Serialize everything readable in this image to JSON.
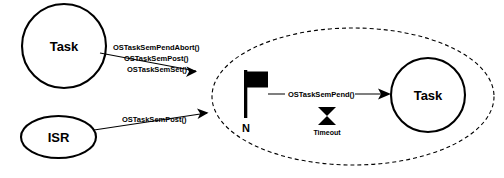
{
  "diagram": {
    "background_color": "#ffffff",
    "stroke_color": "#000000",
    "nodes": {
      "task_left": {
        "label": "Task",
        "shape": "circle"
      },
      "isr": {
        "label": "ISR",
        "shape": "ellipse"
      },
      "task_right": {
        "label": "Task",
        "shape": "circle"
      },
      "flag": {
        "label": "N",
        "shape": "flag"
      },
      "timeout": {
        "label": "Timeout",
        "shape": "hourglass"
      },
      "wait_region": {
        "label": "",
        "shape": "dashed-ellipse"
      }
    },
    "edges": {
      "task_to_region": {
        "labels": [
          "OSTaskSemPendAbort()",
          "OSTaskSemPost()",
          "OSTaskSemSet()"
        ]
      },
      "isr_to_region": {
        "labels": [
          "OSTaskSemPost()"
        ]
      },
      "flag_to_task": {
        "labels": [
          "OSTaskSemPend()"
        ]
      }
    }
  }
}
